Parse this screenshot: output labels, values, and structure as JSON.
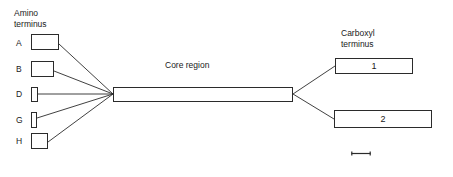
{
  "figure": {
    "background_color": "#ffffff",
    "stroke_color": "#2b2b2b",
    "text_color": "#1a1a1a"
  },
  "amino_side": {
    "heading": "Amino\nterminus",
    "domains": [
      {
        "letter": "A",
        "name": "domain-a"
      },
      {
        "letter": "B",
        "name": "domain-b"
      },
      {
        "letter": "D",
        "name": "domain-d"
      },
      {
        "letter": "G",
        "name": "domain-g"
      },
      {
        "letter": "H",
        "name": "domain-h"
      }
    ]
  },
  "core": {
    "label": "Core region"
  },
  "carboxyl_side": {
    "heading": "Carboxyl\nterminus",
    "domains": [
      {
        "label": "1",
        "name": "domain-1"
      },
      {
        "label": "2",
        "name": "domain-2"
      }
    ]
  },
  "scale_bar": {
    "label": ""
  }
}
